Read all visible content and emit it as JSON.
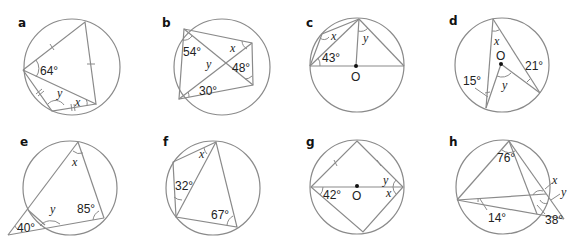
{
  "panels": [
    {
      "id": "a",
      "label": "a",
      "angles": [
        "64°"
      ],
      "unknowns": [
        "y",
        "x"
      ]
    },
    {
      "id": "b",
      "label": "b",
      "angles": [
        "54°",
        "48°",
        "30°"
      ],
      "unknowns": [
        "x",
        "y"
      ]
    },
    {
      "id": "c",
      "label": "c",
      "angles": [
        "43°"
      ],
      "unknowns": [
        "x",
        "y"
      ],
      "center": "O"
    },
    {
      "id": "d",
      "label": "d",
      "angles": [
        "15°",
        "21°"
      ],
      "unknowns": [
        "x",
        "y"
      ],
      "center": "O"
    },
    {
      "id": "e",
      "label": "e",
      "angles": [
        "85°",
        "40°"
      ],
      "unknowns": [
        "x",
        "y"
      ]
    },
    {
      "id": "f",
      "label": "f",
      "angles": [
        "32°",
        "67°"
      ],
      "unknowns": [
        "x"
      ]
    },
    {
      "id": "g",
      "label": "g",
      "angles": [
        "42°"
      ],
      "unknowns": [
        "y",
        "x"
      ],
      "center": "O"
    },
    {
      "id": "h",
      "label": "h",
      "angles": [
        "76°",
        "14°",
        "38°"
      ],
      "unknowns": [
        "x",
        "y"
      ]
    }
  ]
}
